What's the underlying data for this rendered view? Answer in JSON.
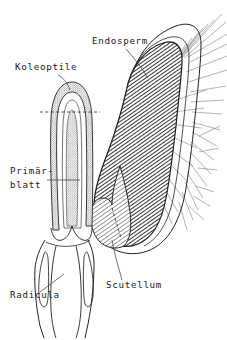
{
  "figure": {
    "background_color": "#ffffff",
    "ink_color": "#1a1a1a",
    "endosperm_fill_color": "#565656",
    "scutellum_fill_color": "#8f8f8f",
    "coleoptile_fill_color": "#b8b8b8"
  },
  "labels": [
    {
      "id": "endosperm",
      "text": "Endosperm",
      "x": 92,
      "y": 44,
      "anchor": "start"
    },
    {
      "id": "koleoptile",
      "text": "Koleoptile",
      "x": 15,
      "y": 70,
      "anchor": "start"
    },
    {
      "id": "primaerblatt-line1",
      "text": "Primär-",
      "x": 10,
      "y": 174,
      "anchor": "start"
    },
    {
      "id": "primaerblatt-line2",
      "text": "blatt",
      "x": 10,
      "y": 188,
      "anchor": "start"
    },
    {
      "id": "scutellum",
      "text": "Scutellum",
      "x": 106,
      "y": 288,
      "anchor": "start"
    },
    {
      "id": "radicula",
      "text": "Radicula",
      "x": 10,
      "y": 298,
      "anchor": "start"
    }
  ],
  "structures": [
    {
      "id": "endosperm",
      "name": "Endosperm",
      "description": "dark hatched storage tissue"
    },
    {
      "id": "scutellum",
      "name": "Scutellum",
      "description": "shield-shaped cotyledon"
    },
    {
      "id": "koleoptile",
      "name": "Koleoptile",
      "description": "protective sheath over the shoot"
    },
    {
      "id": "primaerblatt",
      "name": "Primärblatt",
      "description": "first foliage leaf inside coleoptile"
    },
    {
      "id": "radicula",
      "name": "Radicula",
      "description": "embryonic root"
    }
  ]
}
